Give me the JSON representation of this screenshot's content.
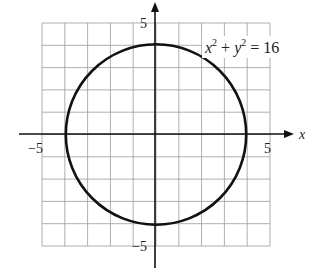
{
  "chart_data": {
    "type": "line",
    "title": "",
    "equation": "x^2 + y^2 = 16",
    "curve": {
      "shape": "circle",
      "center": [
        0,
        0
      ],
      "radius": 4
    },
    "xlabel": "x",
    "ylabel": "",
    "xlim": [
      -5,
      5
    ],
    "ylim": [
      -5,
      5
    ],
    "grid": true,
    "grid_step": 1,
    "ticks": {
      "x_labels": [
        {
          "value": -5,
          "text": "−5"
        },
        {
          "value": 5,
          "text": "5"
        }
      ],
      "y_labels": [
        {
          "value": 5,
          "text": "5"
        },
        {
          "value": -5,
          "text": "−5"
        }
      ]
    },
    "intercepts": [
      [
        4,
        0
      ],
      [
        -4,
        0
      ],
      [
        0,
        4
      ],
      [
        0,
        -4
      ]
    ],
    "annotation": {
      "text": "x² + y² = 16",
      "parts": {
        "x": "x",
        "x_exp": "2",
        "plus": "+",
        "y": "y",
        "y_exp": "2",
        "eq": "= 16"
      }
    }
  },
  "colors": {
    "curve": "#111111",
    "axes": "#111111",
    "grid": "#9a9a9a",
    "background": "#ffffff"
  }
}
